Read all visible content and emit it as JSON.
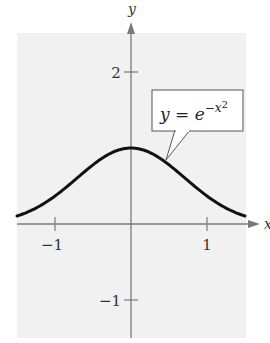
{
  "chart_data": {
    "type": "line",
    "title": "",
    "xlabel": "x",
    "ylabel": "y",
    "xlim": [
      -1.5,
      1.5
    ],
    "ylim": [
      -1.5,
      2.5
    ],
    "grid": false,
    "x_ticks": [
      -1,
      1
    ],
    "x_tick_labels": [
      "−1",
      "1"
    ],
    "y_ticks": [
      2,
      -1
    ],
    "y_tick_labels": [
      "2",
      "−1"
    ],
    "series": [
      {
        "name": "y = e^{-x^2}",
        "function": "exp(-x^2)",
        "x": [
          -1.5,
          -1.25,
          -1.0,
          -0.75,
          -0.5,
          -0.25,
          0.0,
          0.25,
          0.5,
          0.75,
          1.0,
          1.25,
          1.5
        ],
        "values": [
          0.105,
          0.21,
          0.368,
          0.57,
          0.779,
          0.939,
          1.0,
          0.939,
          0.779,
          0.57,
          0.368,
          0.21,
          0.105
        ]
      }
    ],
    "annotations": [
      {
        "text_parts": [
          "y",
          " = ",
          "e",
          "−x",
          "2"
        ],
        "kind": "callout-box",
        "points_to": [
          0.45,
          0.82
        ]
      }
    ],
    "style": {
      "background": "#f1f1f1",
      "axis_color": "#7a7a7a",
      "curve_color": "#111111",
      "box_fill": "#ffffff",
      "box_stroke": "#555555"
    }
  },
  "labels": {
    "x_axis": "x",
    "y_axis": "y",
    "tick_x_neg1": "−1",
    "tick_x_1": "1",
    "tick_y_2": "2",
    "tick_y_neg1": "−1",
    "eq_y": "y",
    "eq_equals": " = ",
    "eq_e": "e",
    "eq_exp": "−x",
    "eq_sq": "2"
  }
}
